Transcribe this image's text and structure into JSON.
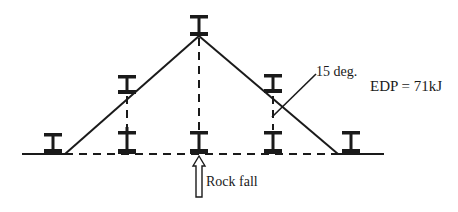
{
  "diagram": {
    "labels": {
      "angle": "15 deg.",
      "energy": "EDP = 71kJ",
      "impact": "Rock fall"
    },
    "colors": {
      "stroke": "#1a1a1a",
      "background": "#ffffff"
    },
    "posts": [
      {
        "id": "left-end",
        "position": "ground"
      },
      {
        "id": "left-mid-upper",
        "position": "on-cable"
      },
      {
        "id": "left-mid-lower",
        "position": "ground"
      },
      {
        "id": "center-top",
        "position": "apex"
      },
      {
        "id": "center-lower",
        "position": "ground"
      },
      {
        "id": "right-mid-upper",
        "position": "on-cable"
      },
      {
        "id": "right-mid-lower",
        "position": "ground"
      },
      {
        "id": "right-end",
        "position": "ground"
      }
    ]
  }
}
